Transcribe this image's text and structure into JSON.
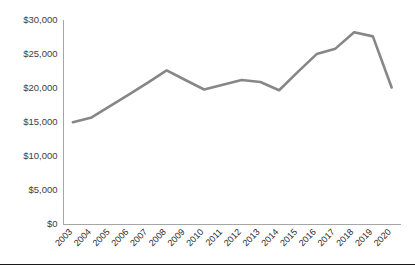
{
  "chart_data": {
    "type": "line",
    "title": "",
    "subtitle": "",
    "xlabel": "",
    "ylabel": "",
    "grid": false,
    "legend": false,
    "legend_position": "none",
    "line_color": "#878787",
    "axis_color": "#a6a6a6",
    "background_color": "#ffffff",
    "ylim": [
      0,
      30000
    ],
    "ytick_values": [
      0,
      5000,
      10000,
      15000,
      20000,
      25000,
      30000
    ],
    "ytick_labels": [
      "$0",
      "$5,000",
      "$10,000",
      "$15,000",
      "$20,000",
      "$25,000",
      "$30,000"
    ],
    "categories": [
      "2003",
      "2004",
      "2005",
      "2006",
      "2007",
      "2008",
      "2009",
      "2010",
      "2011",
      "2012",
      "2013",
      "2014",
      "2015",
      "2016",
      "2017",
      "2018",
      "2019",
      "2020"
    ],
    "values": [
      15000,
      15700,
      17400,
      19100,
      20800,
      22600,
      21200,
      19800,
      20500,
      21200,
      20900,
      19700,
      22400,
      25000,
      25800,
      28200,
      27600,
      20100
    ],
    "series": [
      {
        "name": "",
        "color": "#878787",
        "values": [
          15000,
          15700,
          17400,
          19100,
          20800,
          22600,
          21200,
          19800,
          20500,
          21200,
          20900,
          19700,
          22400,
          25000,
          25800,
          28200,
          27600,
          20100
        ]
      }
    ]
  }
}
